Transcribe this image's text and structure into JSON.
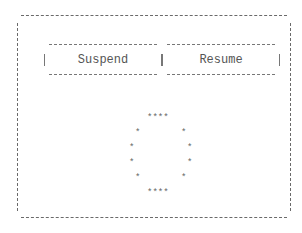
{
  "buttons": {
    "suspend_label": "Suspend",
    "resume_label": "Resume"
  },
  "spinner": {
    "glyph": "*",
    "top_row": "****",
    "bottom_row": "****"
  }
}
